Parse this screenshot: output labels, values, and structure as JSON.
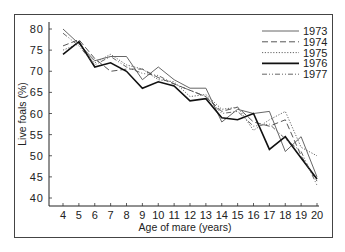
{
  "chart_data": {
    "type": "line",
    "title": "",
    "xlabel": "Age of mare (years)",
    "ylabel": "Live foals (%)",
    "x": [
      4,
      5,
      6,
      7,
      8,
      9,
      10,
      11,
      12,
      13,
      14,
      15,
      16,
      17,
      18,
      19,
      20
    ],
    "xlim": [
      3.3,
      20.2
    ],
    "ylim": [
      38.5,
      81.5
    ],
    "yticks": [
      40,
      45,
      50,
      55,
      60,
      65,
      70,
      75,
      80
    ],
    "xticks": [
      4,
      5,
      6,
      7,
      8,
      9,
      10,
      11,
      12,
      13,
      14,
      15,
      16,
      17,
      18,
      19,
      20
    ],
    "grid": false,
    "legend_position": "upper right",
    "series": [
      {
        "name": "1973",
        "style": "solid-thin",
        "values": [
          80.0,
          76.5,
          72.5,
          73.5,
          73.5,
          68.0,
          71.0,
          68.0,
          66.0,
          66.0,
          58.0,
          61.0,
          60.0,
          60.5,
          51.0,
          54.5,
          45.0
        ]
      },
      {
        "name": "1974",
        "style": "dashed",
        "values": [
          76.0,
          77.5,
          73.0,
          70.0,
          70.5,
          70.5,
          68.5,
          67.0,
          65.5,
          64.0,
          60.5,
          61.5,
          58.0,
          57.0,
          58.5,
          50.0,
          44.0
        ]
      },
      {
        "name": "1975",
        "style": "dotted",
        "values": [
          75.0,
          76.5,
          72.0,
          74.0,
          71.5,
          70.5,
          68.0,
          67.5,
          64.0,
          64.5,
          61.0,
          61.5,
          56.0,
          58.5,
          60.5,
          52.0,
          50.0
        ]
      },
      {
        "name": "1976",
        "style": "solid-thick",
        "values": [
          74.0,
          77.0,
          71.0,
          72.0,
          70.0,
          66.0,
          67.5,
          66.5,
          63.0,
          63.5,
          59.0,
          58.5,
          60.0,
          51.5,
          54.5,
          49.5,
          44.5
        ]
      },
      {
        "name": "1977",
        "style": "dash-dot",
        "values": [
          79.0,
          76.0,
          71.5,
          73.5,
          71.0,
          69.5,
          69.0,
          67.0,
          65.5,
          64.0,
          60.0,
          60.5,
          57.0,
          57.5,
          54.0,
          51.0,
          43.0
        ]
      }
    ]
  },
  "legend": {
    "items": [
      "1973",
      "1974",
      "1975",
      "1976",
      "1977"
    ]
  },
  "axes": {
    "ylabel": "Live foals (%)",
    "xlabel": "Age of mare (years)"
  }
}
